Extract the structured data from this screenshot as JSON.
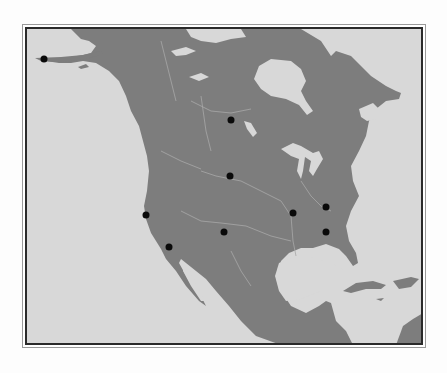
{
  "map": {
    "region": "North America",
    "style": "grayscale relief outline map",
    "colors": {
      "water": "#d8d8d8",
      "land": "#7d7d7d",
      "rivers": "#a8a8a8",
      "border_dark": "#2a2a2a",
      "marker": "#0a0a0a"
    },
    "markers": [
      {
        "id": "alaska",
        "x": 43,
        "y": 58
      },
      {
        "id": "central-canada",
        "x": 230,
        "y": 119
      },
      {
        "id": "great-plains",
        "x": 229,
        "y": 175
      },
      {
        "id": "northern-california",
        "x": 145,
        "y": 214
      },
      {
        "id": "southern-california",
        "x": 168,
        "y": 246
      },
      {
        "id": "southwest",
        "x": 223,
        "y": 231
      },
      {
        "id": "mississippi-valley",
        "x": 292,
        "y": 212
      },
      {
        "id": "east-coast-north",
        "x": 325,
        "y": 206
      },
      {
        "id": "east-coast-south",
        "x": 325,
        "y": 231
      }
    ]
  }
}
